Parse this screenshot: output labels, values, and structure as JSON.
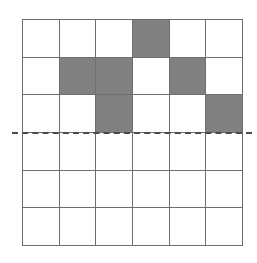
{
  "diagram": {
    "type": "grid",
    "rows": 6,
    "cols": 6,
    "colors": {
      "filled": "#808080",
      "empty": "#ffffff",
      "grid_line": "#6e6e6e",
      "dashed_line": "#4a4a4a"
    },
    "filled_cells": [
      {
        "row": 0,
        "col": 3
      },
      {
        "row": 1,
        "col": 1
      },
      {
        "row": 1,
        "col": 2
      },
      {
        "row": 1,
        "col": 4
      },
      {
        "row": 2,
        "col": 2
      },
      {
        "row": 2,
        "col": 5
      }
    ],
    "dashed_line": {
      "orientation": "horizontal",
      "after_row": 2,
      "style": "dashed"
    }
  }
}
